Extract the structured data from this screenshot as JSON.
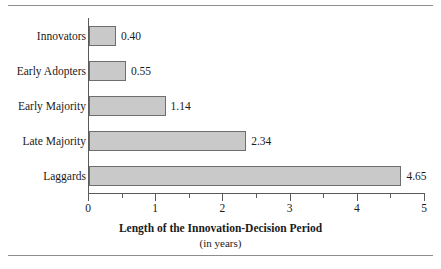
{
  "chart_data": {
    "type": "bar",
    "orientation": "horizontal",
    "title": "",
    "xlabel": "Length of the Innovation-Decision Period",
    "xlabel_sub": "(in years)",
    "ylabel": "",
    "categories": [
      "Innovators",
      "Early Adopters",
      "Early Majority",
      "Late Majority",
      "Laggards"
    ],
    "values": [
      0.4,
      0.55,
      1.14,
      2.34,
      4.65
    ],
    "value_labels": [
      "0.40",
      "0.55",
      "1.14",
      "2.34",
      "4.65"
    ],
    "xlim": [
      0,
      5
    ],
    "xticks": [
      0,
      1,
      2,
      3,
      4,
      5
    ],
    "xtick_labels": [
      "0",
      "1",
      "2",
      "3",
      "4",
      "5"
    ],
    "xticks_minor": [
      0.5,
      1.5,
      2.5,
      3.5,
      4.5
    ],
    "grid": false,
    "legend": false,
    "bar_color": "#c9c9c9",
    "bar_edge_color": "#6e6e6e",
    "axis_color": "#5a5a5a",
    "background": "#ffffff"
  },
  "rules": {
    "top_rule_color": "#8d8d8d",
    "bottom_rule_color": "#8d8d8d"
  }
}
